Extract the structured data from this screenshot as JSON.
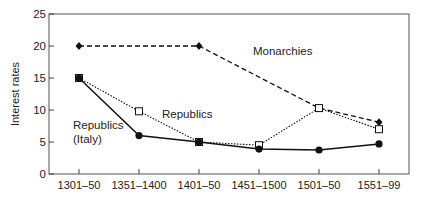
{
  "chart_data": {
    "type": "line",
    "title": "",
    "xlabel": "",
    "ylabel": "Interest rates",
    "categories": [
      "1301–50",
      "1351–1400",
      "1401–50",
      "1451–1500",
      "1501–50",
      "1551–99"
    ],
    "ylim": [
      0,
      25
    ],
    "yticks": [
      0,
      5,
      10,
      15,
      20,
      25
    ],
    "grid": false,
    "legend": "inline labels",
    "series": [
      {
        "name": "Monarchies",
        "label": "Monarchies",
        "style": "dashed",
        "marker": "diamond-filled",
        "values": [
          20,
          null,
          20,
          null,
          10.3,
          8.1
        ]
      },
      {
        "name": "Republics",
        "label": "Republics",
        "style": "dotted",
        "marker": "square-open",
        "values": [
          15,
          9.8,
          5.0,
          4.5,
          10.3,
          7.0
        ]
      },
      {
        "name": "Republics (Italy)",
        "label_lines": [
          "Republics",
          "(Italy)"
        ],
        "style": "solid",
        "marker": "circle-filled",
        "values": [
          15,
          6.0,
          5.0,
          3.9,
          3.75,
          4.7
        ]
      }
    ]
  }
}
